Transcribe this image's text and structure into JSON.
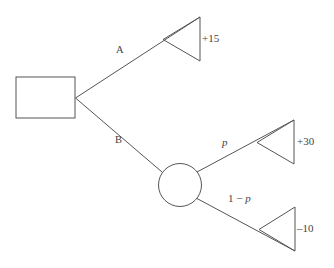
{
  "diagram": {
    "type": "decision-tree",
    "title": "",
    "colors": {
      "stroke": "#555555",
      "text": "#444444",
      "background": "#ffffff"
    },
    "nodes": [
      {
        "id": "decision-node",
        "shape": "square",
        "label": "",
        "x": 16,
        "y": 77,
        "width": 59,
        "height": 41
      },
      {
        "id": "chance-node",
        "shape": "circle",
        "label": "",
        "cx": 180,
        "cy": 185,
        "r": 21.5
      }
    ],
    "branches": [
      {
        "id": "branch-a",
        "label": "A",
        "from": "decision-node",
        "to": "terminal-15",
        "label_x": 116,
        "label_y": 50
      },
      {
        "id": "branch-b",
        "label": "B",
        "from": "decision-node",
        "to": "chance-node",
        "label_x": 115,
        "label_y": 140
      },
      {
        "id": "branch-p",
        "label": "p",
        "from": "chance-node",
        "to": "terminal-30",
        "label_x": 222,
        "label_y": 143
      },
      {
        "id": "branch-1-minus-p",
        "label_prefix": "1 − ",
        "label": "p",
        "from": "chance-node",
        "to": "terminal-minus-10",
        "label_x": 228,
        "label_y": 198
      }
    ],
    "terminals": [
      {
        "id": "terminal-15",
        "payoff": "+15",
        "apex_x": 163,
        "apex_y": 39.5,
        "right_x": 200,
        "top_y": 17,
        "bottom_y": 61,
        "text_x": 202,
        "text_y": 33
      },
      {
        "id": "terminal-30",
        "payoff": "+30",
        "apex_x": 257,
        "apex_y": 142.5,
        "right_x": 294,
        "top_y": 120,
        "bottom_y": 164,
        "text_x": 297,
        "text_y": 136
      },
      {
        "id": "terminal-minus-10",
        "payoff": "–10",
        "apex_x": 259,
        "apex_y": 229.5,
        "right_x": 295,
        "top_y": 207,
        "bottom_y": 251,
        "text_x": 297,
        "text_y": 223
      }
    ]
  }
}
